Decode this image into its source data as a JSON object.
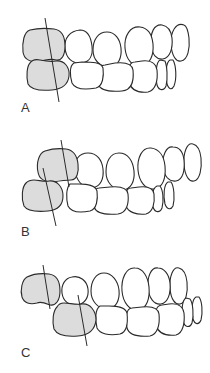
{
  "figure": {
    "panels": [
      {
        "id": "A",
        "label": "A",
        "description": "Upper and lower first molars (shaded) aligned with long-axis line through both"
      },
      {
        "id": "B",
        "label": "B",
        "description": "Lower shaded molar positioned mesially relative to upper shaded molar, axis lines offset"
      },
      {
        "id": "C",
        "label": "C",
        "description": "Lower shaded molar positioned distally relative to upper shaded molar, axis lines offset"
      }
    ],
    "colors": {
      "outline": "#2a2a2a",
      "shaded_tooth": "#dcdcdc",
      "background": "#ffffff"
    }
  }
}
